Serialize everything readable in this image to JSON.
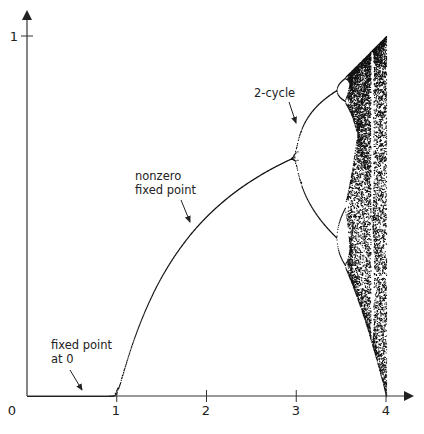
{
  "chart_data": {
    "type": "scatter",
    "title": "",
    "subtitle": "Bifurcation diagram of the logistic map",
    "xlabel": "",
    "ylabel": "",
    "xlim": [
      0,
      4
    ],
    "ylim": [
      0,
      1
    ],
    "grid": false,
    "legend": null,
    "x_ticks": [
      "1",
      "2",
      "3",
      "4"
    ],
    "y_ticks": [
      "1"
    ],
    "origin_label": "0",
    "series": [
      {
        "name": "attractor",
        "description": "Long-run values of x for x_{n+1} = r·x_n·(1 − x_n), plotted against r in [0, 4]",
        "r_min": 0.0,
        "r_max": 4.0,
        "r_steps": 900,
        "points_per_r": 90,
        "transient": 300
      }
    ],
    "key_points": [
      {
        "r": 1.0,
        "x": 0.0,
        "note": "transcritical bifurcation"
      },
      {
        "r": 2.0,
        "x": 0.5,
        "note": "nonzero fixed point"
      },
      {
        "r": 3.0,
        "x": 0.667,
        "note": "period-doubling to 2-cycle"
      },
      {
        "r": 3.449,
        "x": 0.852,
        "note": "period-doubling to 4-cycle"
      },
      {
        "r": 4.0,
        "x": 1.0,
        "note": "full chaos"
      }
    ],
    "annotations": [
      {
        "text_lines": [
          "fixed point",
          "at 0"
        ],
        "arrow_to": {
          "r": 0.68,
          "x": 0.0
        }
      },
      {
        "text_lines": [
          "nonzero",
          "fixed point"
        ],
        "arrow_to": {
          "r": 1.75,
          "x": 0.43
        }
      },
      {
        "text_lines": [
          "2-cycle"
        ],
        "arrow_to": {
          "r": 3.02,
          "x": 0.7
        }
      }
    ]
  },
  "axes": {
    "origin_px": [
      27,
      396
    ],
    "x_unit_px": 89.75,
    "y_unit_px": 360,
    "x_end_px": 412,
    "y_end_px": 12,
    "color": "#333333",
    "point_color": "#111111"
  },
  "labels": {
    "origin": "0",
    "x1": "1",
    "x2": "2",
    "x3": "3",
    "x4": "4",
    "y1": "1",
    "fixed0_line1": "fixed point",
    "fixed0_line2": "at 0",
    "nonzero_line1": "nonzero",
    "nonzero_line2": "fixed point",
    "cycle2": "2-cycle"
  }
}
